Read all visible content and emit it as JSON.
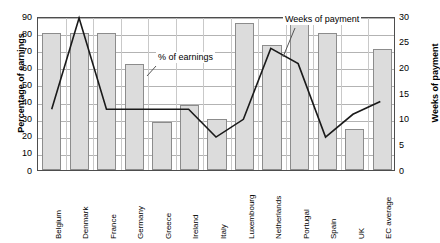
{
  "chart_data": {
    "type": "bar",
    "title": "",
    "subtitle": "",
    "xlabel": "",
    "ylabel": "Percentage of earnings",
    "y2label": "Weeks of payment",
    "ylim": [
      0,
      90
    ],
    "y2lim": [
      0,
      30
    ],
    "yticks": [
      0,
      10,
      20,
      30,
      40,
      50,
      60,
      70,
      80,
      90
    ],
    "y2ticks": [
      0,
      5,
      10,
      15,
      20,
      25,
      30
    ],
    "grid": true,
    "legend_position": "inline-annotations",
    "categories": [
      "Belgium",
      "Denmark",
      "France",
      "Germany",
      "Greece",
      "Ireland",
      "Italy",
      "Luxembourg",
      "Netherlands",
      "Portugal",
      "Spain",
      "UK",
      "EC average"
    ],
    "series": [
      {
        "name": "% of earnings",
        "type": "bar",
        "axis": "left",
        "unit": "percent",
        "values": [
          80,
          80,
          80,
          62,
          28,
          38,
          30,
          86,
          73,
          90,
          80,
          24,
          71
        ]
      },
      {
        "name": "Weeks of payment",
        "type": "line",
        "axis": "right",
        "unit": "weeks",
        "values": [
          12,
          30,
          12,
          12,
          12,
          12,
          6.5,
          10,
          24,
          21,
          6.5,
          11,
          13.5
        ]
      }
    ],
    "annotations": [
      {
        "id": "earnings",
        "text": "% of earnings",
        "points_to": "bar-series"
      },
      {
        "id": "weeks",
        "text": "Weeks of payment",
        "points_to": "line-series"
      }
    ]
  }
}
